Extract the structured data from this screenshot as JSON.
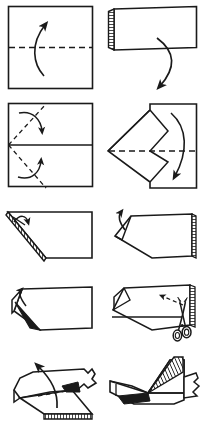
{
  "document": {
    "title": "Origami Folding Instructions",
    "kind": "instructional-diagram",
    "width": 207,
    "height": 438,
    "background_color": "#ffffff",
    "ink_color": "#1a1a1a",
    "shade_color": "#2b2b2b",
    "columns": 2,
    "rows": 5,
    "panel_count": 10
  },
  "legend": {
    "solid_line": "existing edge or finished fold",
    "dashed_line": "valley fold / crease line or cut line",
    "curved_arrow": "direction of fold",
    "hatched_edge": "folded-over layered edge (shaded)",
    "scissors": "cut along the dashed line"
  },
  "panels": [
    {
      "index": 1,
      "row": 1,
      "column": 1,
      "name": "step-1-square-fold-in-half",
      "caption": "Square sheet: fold in half along the horizontal dashed crease",
      "shape": "square",
      "crease_style": "dashed-horizontal",
      "arrow": "curved-up"
    },
    {
      "index": 2,
      "row": 1,
      "column": 2,
      "name": "step-2-folded-rectangle",
      "caption": "Result is a rectangle; fold edge is shaded at left. Unfold downward",
      "shape": "rectangle-tilted",
      "crease_style": "none",
      "arrow": "curved-down-left",
      "hatched_edge": "left"
    },
    {
      "index": 3,
      "row": 2,
      "column": 1,
      "name": "step-3-diagonal-creases",
      "caption": "Unfolded square with centre crease; fold both corners to the centre line",
      "shape": "square-with-center-line",
      "crease_style": "dashed-diagonals",
      "arrow": "two-curved-inward"
    },
    {
      "index": 4,
      "row": 2,
      "column": 2,
      "name": "step-4-point-formed",
      "caption": "Corners folded in form a point at the left; fold in half downward",
      "shape": "kite-point-left",
      "crease_style": "dashed-horizontal",
      "arrow": "curved-down"
    },
    {
      "index": 5,
      "row": 3,
      "column": 1,
      "name": "step-5-trapezoid-left-flap",
      "caption": "Folded shape with shaded diagonal edge; lift the small flap",
      "shape": "trapezoid",
      "crease_style": "none",
      "arrow": "small-short-arrow",
      "hatched_edge": "diagonal-left"
    },
    {
      "index": 6,
      "row": 3,
      "column": 2,
      "name": "step-6-flap-pulled",
      "caption": "Flap pulled out at the left; shaded layered edge at right",
      "shape": "pentagon-point-left",
      "crease_style": "none",
      "arrow": "small-hook-arrow",
      "hatched_edge": "right"
    },
    {
      "index": 7,
      "row": 4,
      "column": 1,
      "name": "step-7-pull-out-flap",
      "caption": "Pull the inner flap out toward the upper left",
      "shape": "pentagon-with-inner-flap",
      "crease_style": "none",
      "arrow": "thick-arrow-up-left"
    },
    {
      "index": 8,
      "row": 4,
      "column": 2,
      "name": "step-8-cut-with-scissors",
      "caption": "Cut along the dashed line with scissors",
      "shape": "three-dimensional-body",
      "crease_style": "dashed-cut-line",
      "arrow": "dashed-arrow-up-left",
      "tool": "scissors",
      "hatched_edge": "right"
    },
    {
      "index": 9,
      "row": 5,
      "column": 1,
      "name": "step-9-lift-cut-section",
      "caption": "Lift the cut section upward; torn edge at the right, shaded base",
      "shape": "three-dimensional-body-torn",
      "crease_style": "dashed-fold",
      "arrow": "curved-up",
      "hatched_edge": "bottom"
    },
    {
      "index": 10,
      "row": 5,
      "column": 2,
      "name": "step-10-finished-model",
      "caption": "Finished model with raised striped fin",
      "shape": "finished-figure",
      "crease_style": "none",
      "arrow": "none",
      "hatched_edge": "fin-stripes"
    }
  ]
}
